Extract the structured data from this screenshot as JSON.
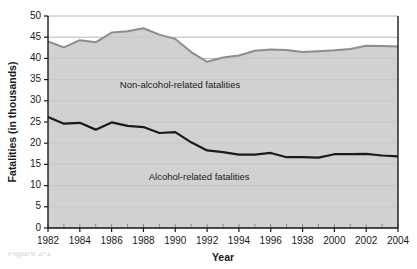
{
  "chart_data": {
    "type": "area",
    "title": "",
    "xlabel": "Year",
    "ylabel": "Fatalities (in thousands)",
    "xlim": [
      1982,
      2004
    ],
    "ylim": [
      0,
      50
    ],
    "yticks": [
      0,
      5,
      10,
      15,
      20,
      25,
      30,
      35,
      40,
      45,
      50
    ],
    "xticks": [
      1982,
      1984,
      1986,
      1988,
      1990,
      1992,
      1994,
      1996,
      1998,
      2000,
      2002,
      2004
    ],
    "xtick_labels": [
      "1982",
      "1984",
      "1986",
      "1988",
      "1990",
      "1992",
      "1994",
      "1996",
      "1938",
      "2000",
      "2002",
      "2004"
    ],
    "ytick_labels": [
      "0",
      "5",
      "10",
      "15",
      "20",
      "25",
      "30",
      "35",
      "40",
      "45",
      "50"
    ],
    "grid": "horizontal",
    "legend": "inline-annotations",
    "x": [
      1982,
      1983,
      1984,
      1985,
      1986,
      1987,
      1988,
      1989,
      1990,
      1991,
      1992,
      1993,
      1994,
      1995,
      1996,
      1997,
      1998,
      1999,
      2000,
      2001,
      2002,
      2003,
      2004
    ],
    "series": [
      {
        "name": "Total fatalities",
        "values": [
          44.0,
          42.6,
          44.3,
          43.8,
          46.1,
          46.4,
          47.1,
          45.6,
          44.6,
          41.5,
          39.2,
          40.2,
          40.7,
          41.8,
          42.1,
          42.0,
          41.5,
          41.7,
          41.9,
          42.2,
          43.0,
          42.9,
          42.8
        ]
      },
      {
        "name": "Alcohol-related fatalities",
        "values": [
          26.2,
          24.6,
          24.8,
          23.2,
          24.9,
          24.1,
          23.8,
          22.4,
          22.6,
          20.2,
          18.3,
          17.9,
          17.3,
          17.3,
          17.7,
          16.7,
          16.7,
          16.6,
          17.4,
          17.4,
          17.5,
          17.1,
          16.9
        ]
      }
    ],
    "annotations": [
      {
        "text": "Non-alcohol-related fatalities",
        "x": 1990.3,
        "y": 33.5
      },
      {
        "text": "Alcohol-related fatalities",
        "x": 1991.5,
        "y": 12.0
      }
    ],
    "colors": {
      "band_fill": "#c9c9c9",
      "total_line": "#8d8d8d",
      "alcohol_line": "#1a1a1a",
      "grid": "#9a9a9a",
      "axis": "#1a1a1a",
      "background": "#ffffff"
    }
  },
  "caption": {
    "fragment": "Figure 2-1"
  }
}
